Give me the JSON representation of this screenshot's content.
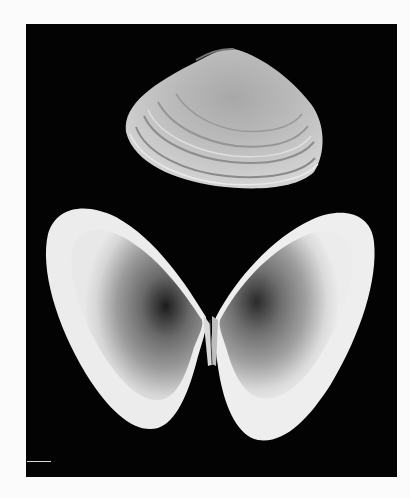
{
  "figure": {
    "views": [
      {
        "name": "exterior-view",
        "description": "closed shell, external surface with concentric growth rings"
      },
      {
        "name": "interior-view",
        "description": "two opened valves showing interior surfaces"
      }
    ],
    "colors": {
      "background_page": "#fbfbfb",
      "photo_background": "#030303",
      "shell_light": "#e8e8e8",
      "shell_mid": "#9a9a9a",
      "shell_dark": "#2a2a2a"
    }
  }
}
